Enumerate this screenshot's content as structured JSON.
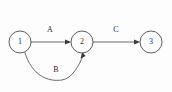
{
  "diagram": {
    "type": "directed-graph",
    "background_color": "#fdfdfd",
    "stroke_color": "#5a5a5a",
    "text_color": "#2b2b2b",
    "nodes": [
      {
        "id": "1",
        "label": "1",
        "cx": 20,
        "cy": 42,
        "r": 11
      },
      {
        "id": "2",
        "label": "2",
        "cx": 82,
        "cy": 42,
        "r": 11
      },
      {
        "id": "3",
        "label": "3",
        "cx": 151,
        "cy": 42,
        "r": 11
      }
    ],
    "edges": [
      {
        "id": "edge-a",
        "label": "A",
        "from": "1",
        "to": "2",
        "shape": "straight",
        "label_x": 50,
        "label_y": 30,
        "path": "M 31 42 L 69 42",
        "arrow": "M 71 42 L 65 39.4 L 65 44.6 Z"
      },
      {
        "id": "edge-b",
        "label": "B",
        "from": "1",
        "to": "2",
        "shape": "curved",
        "label_x": 56,
        "label_y": 70,
        "path": "M 24.5 51.5 C 32 76 48 82 62 80 C 72 78.5 79 66 83.5 54.5",
        "arrow": "M 82.2 52 L 80.6 58.4 L 85.6 56.1 Z"
      },
      {
        "id": "edge-c",
        "label": "C",
        "from": "2",
        "to": "3",
        "shape": "straight",
        "label_x": 116,
        "label_y": 30,
        "path": "M 93 42 L 138 42",
        "arrow": "M 140 42 L 134 39.4 L 134 44.6 Z"
      }
    ]
  }
}
